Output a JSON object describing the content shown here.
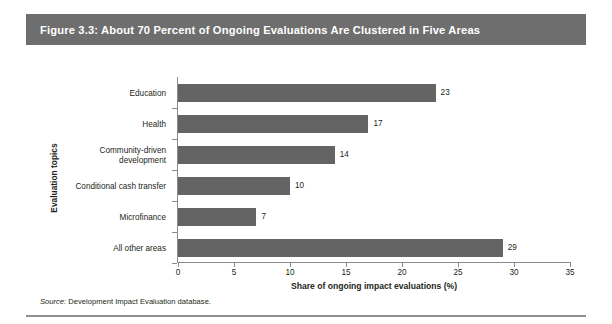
{
  "figure": {
    "title": "Figure 3.3: About 70 Percent of Ongoing Evaluations Are Clustered in Five Areas",
    "source_label": "Source:",
    "source_text": " Development Impact Evaluation database."
  },
  "colors": {
    "title_bar_bg": "#6e6e6e",
    "title_text": "#ffffff",
    "bar_fill": "#646464",
    "axis_line": "#8a8a8a",
    "text": "#231f20",
    "rule": "#8f8f8f"
  },
  "chart_data": {
    "type": "bar",
    "orientation": "horizontal",
    "title": "Figure 3.3: About 70 Percent of Ongoing Evaluations Are Clustered in Five Areas",
    "categories": [
      "Education",
      "Health",
      "Community-driven\ndevelopment",
      "Conditional cash transfer",
      "Microfinance",
      "All other areas"
    ],
    "values": [
      23,
      17,
      14,
      10,
      7,
      29
    ],
    "value_labels": [
      "23",
      "17",
      "14",
      "10",
      "7",
      "29"
    ],
    "xlabel": "Share of ongoing impact evaluations (%)",
    "ylabel": "Evaluation topics",
    "xlim": [
      0,
      35
    ],
    "xticks": [
      0,
      5,
      10,
      15,
      20,
      25,
      30,
      35
    ],
    "xtick_labels": [
      "0",
      "5",
      "10",
      "15",
      "20",
      "25",
      "30",
      "35"
    ],
    "grid": false,
    "legend": null
  }
}
